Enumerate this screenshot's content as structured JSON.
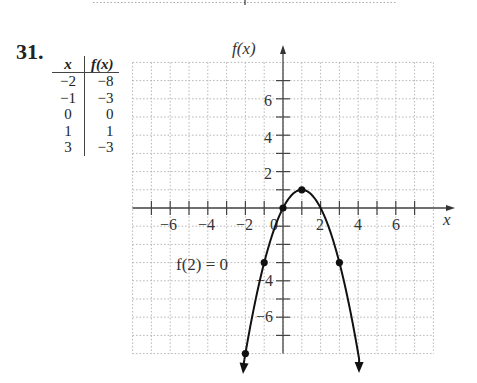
{
  "problem": {
    "number": "31."
  },
  "table": {
    "headers": [
      "x",
      "f(x)"
    ],
    "rows": [
      [
        "−2",
        "−8"
      ],
      [
        "−1",
        "−3"
      ],
      [
        "0",
        "0"
      ],
      [
        "1",
        "1"
      ],
      [
        "3",
        "−3"
      ]
    ]
  },
  "annotation": "f(2) = 0",
  "chart_data": {
    "type": "line",
    "title": "",
    "xlabel": "x",
    "ylabel": "f(x)",
    "xlim": [
      -8,
      8
    ],
    "ylim": [
      -8,
      8
    ],
    "grid": true,
    "x_tick_labels": [
      "−6",
      "−4",
      "−2",
      "2",
      "4",
      "6"
    ],
    "y_tick_labels": [
      "6",
      "4",
      "2",
      "−4",
      "−6"
    ],
    "origin_label": "0",
    "points": [
      {
        "x": -2,
        "y": -8
      },
      {
        "x": -1,
        "y": -3
      },
      {
        "x": 0,
        "y": 0
      },
      {
        "x": 1,
        "y": 1
      },
      {
        "x": 3,
        "y": -3
      }
    ],
    "series": [
      {
        "name": "f(x) = -x^2 + 2x",
        "curve": "parabola opening downward, vertex (1,1), arrows at both ends"
      }
    ],
    "annotations": [
      {
        "text": "f(2) = 0",
        "x": -4.5,
        "y": -3
      }
    ]
  }
}
